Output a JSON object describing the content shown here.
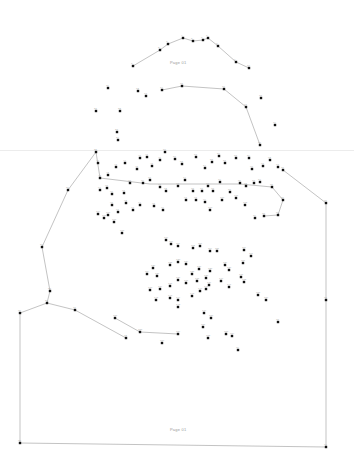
{
  "page": {
    "background": "#ffffff",
    "dot_color": "#111111",
    "line_color": "#9a9a9a",
    "top_label": "Page 01",
    "bottom_label": "Page 01"
  },
  "paths": [
    [
      [
        133,
        66
      ],
      [
        160,
        50
      ],
      [
        168,
        44
      ],
      [
        183,
        38
      ],
      [
        193,
        41
      ],
      [
        203,
        40
      ],
      [
        208,
        38
      ],
      [
        218,
        46
      ],
      [
        236,
        62
      ],
      [
        249,
        68
      ]
    ],
    [
      [
        162,
        90
      ],
      [
        182,
        86
      ],
      [
        224,
        89
      ],
      [
        246,
        107
      ],
      [
        260,
        145
      ]
    ],
    [
      [
        96,
        152
      ],
      [
        68,
        190
      ],
      [
        42,
        247
      ],
      [
        50,
        291
      ],
      [
        47,
        303
      ],
      [
        20,
        313
      ],
      [
        20,
        443
      ],
      [
        326,
        447
      ],
      [
        326,
        300
      ],
      [
        326,
        203
      ],
      [
        283,
        170
      ]
    ],
    [
      [
        47,
        303
      ],
      [
        75,
        310
      ],
      [
        126,
        338
      ]
    ],
    [
      [
        96,
        152
      ],
      [
        100,
        178
      ],
      [
        150,
        184
      ],
      [
        195,
        184
      ],
      [
        240,
        184
      ],
      [
        272,
        187
      ],
      [
        283,
        200
      ],
      [
        278,
        215
      ],
      [
        264,
        216
      ]
    ],
    [
      [
        115,
        318
      ],
      [
        140,
        332
      ],
      [
        178,
        334
      ]
    ]
  ],
  "dots": [
    [
      133,
      66
    ],
    [
      160,
      50
    ],
    [
      168,
      44
    ],
    [
      183,
      38
    ],
    [
      193,
      41
    ],
    [
      203,
      40
    ],
    [
      208,
      38
    ],
    [
      218,
      46
    ],
    [
      236,
      62
    ],
    [
      249,
      68
    ],
    [
      108,
      88
    ],
    [
      138,
      91
    ],
    [
      146,
      96
    ],
    [
      162,
      90
    ],
    [
      182,
      86
    ],
    [
      224,
      89
    ],
    [
      246,
      107
    ],
    [
      261,
      98
    ],
    [
      275,
      125
    ],
    [
      260,
      145
    ],
    [
      96,
      111
    ],
    [
      120,
      111
    ],
    [
      117,
      132
    ],
    [
      118,
      140
    ],
    [
      96,
      152
    ],
    [
      68,
      190
    ],
    [
      42,
      247
    ],
    [
      50,
      291
    ],
    [
      47,
      303
    ],
    [
      20,
      313
    ],
    [
      75,
      310
    ],
    [
      126,
      338
    ],
    [
      20,
      443
    ],
    [
      326,
      447
    ],
    [
      326,
      300
    ],
    [
      326,
      203
    ],
    [
      283,
      170
    ],
    [
      278,
      322
    ],
    [
      238,
      350
    ],
    [
      98,
      163
    ],
    [
      100,
      178
    ],
    [
      108,
      175
    ],
    [
      116,
      167
    ],
    [
      125,
      163
    ],
    [
      137,
      169
    ],
    [
      140,
      158
    ],
    [
      147,
      157
    ],
    [
      152,
      166
    ],
    [
      160,
      160
    ],
    [
      165,
      152
    ],
    [
      175,
      159
    ],
    [
      182,
      164
    ],
    [
      196,
      157
    ],
    [
      205,
      168
    ],
    [
      212,
      162
    ],
    [
      219,
      156
    ],
    [
      225,
      163
    ],
    [
      236,
      158
    ],
    [
      249,
      158
    ],
    [
      252,
      169
    ],
    [
      263,
      166
    ],
    [
      270,
      160
    ],
    [
      278,
      167
    ],
    [
      100,
      190
    ],
    [
      107,
      188
    ],
    [
      112,
      194
    ],
    [
      124,
      193
    ],
    [
      130,
      183
    ],
    [
      143,
      183
    ],
    [
      150,
      180
    ],
    [
      160,
      187
    ],
    [
      166,
      191
    ],
    [
      178,
      186
    ],
    [
      185,
      180
    ],
    [
      193,
      191
    ],
    [
      202,
      191
    ],
    [
      208,
      186
    ],
    [
      213,
      191
    ],
    [
      220,
      182
    ],
    [
      230,
      192
    ],
    [
      240,
      183
    ],
    [
      246,
      186
    ],
    [
      254,
      183
    ],
    [
      260,
      182
    ],
    [
      272,
      187
    ],
    [
      283,
      200
    ],
    [
      278,
      215
    ],
    [
      264,
      216
    ],
    [
      255,
      218
    ],
    [
      112,
      205
    ],
    [
      118,
      212
    ],
    [
      126,
      203
    ],
    [
      133,
      210
    ],
    [
      140,
      205
    ],
    [
      154,
      206
    ],
    [
      163,
      210
    ],
    [
      186,
      200
    ],
    [
      196,
      200
    ],
    [
      205,
      202
    ],
    [
      222,
      200
    ],
    [
      236,
      198
    ],
    [
      245,
      205
    ],
    [
      210,
      210
    ],
    [
      98,
      214
    ],
    [
      104,
      218
    ],
    [
      108,
      215
    ],
    [
      114,
      222
    ],
    [
      122,
      233
    ],
    [
      166,
      240
    ],
    [
      171,
      244
    ],
    [
      178,
      246
    ],
    [
      193,
      248
    ],
    [
      200,
      246
    ],
    [
      210,
      251
    ],
    [
      217,
      251
    ],
    [
      244,
      250
    ],
    [
      251,
      256
    ],
    [
      243,
      263
    ],
    [
      147,
      274
    ],
    [
      153,
      268
    ],
    [
      157,
      276
    ],
    [
      170,
      265
    ],
    [
      178,
      262
    ],
    [
      186,
      264
    ],
    [
      192,
      274
    ],
    [
      199,
      269
    ],
    [
      206,
      278
    ],
    [
      210,
      271
    ],
    [
      225,
      265
    ],
    [
      229,
      270
    ],
    [
      241,
      277
    ],
    [
      244,
      282
    ],
    [
      150,
      290
    ],
    [
      160,
      289
    ],
    [
      170,
      286
    ],
    [
      178,
      280
    ],
    [
      186,
      283
    ],
    [
      197,
      281
    ],
    [
      209,
      285
    ],
    [
      221,
      281
    ],
    [
      229,
      287
    ],
    [
      156,
      300
    ],
    [
      170,
      298
    ],
    [
      178,
      300
    ],
    [
      192,
      296
    ],
    [
      200,
      291
    ],
    [
      206,
      289
    ],
    [
      178,
      307
    ],
    [
      204,
      313
    ],
    [
      211,
      318
    ],
    [
      203,
      327
    ],
    [
      208,
      338
    ],
    [
      226,
      334
    ],
    [
      232,
      336
    ],
    [
      258,
      295
    ],
    [
      266,
      300
    ],
    [
      115,
      318
    ],
    [
      140,
      332
    ],
    [
      178,
      334
    ],
    [
      162,
      343
    ]
  ]
}
